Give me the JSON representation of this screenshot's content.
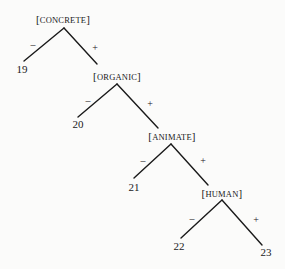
{
  "diagram": {
    "type": "binary-feature-tree",
    "nodes": [
      {
        "id": "concrete",
        "label_open": "[",
        "label_text": "CONCRETE",
        "label_close": "]",
        "minus_child": "19",
        "plus_child": "organic"
      },
      {
        "id": "organic",
        "label_open": "[",
        "label_text": "ORGANIC",
        "label_close": "]",
        "minus_child": "20",
        "plus_child": "animate"
      },
      {
        "id": "animate",
        "label_open": "[",
        "label_text": "ANIMATE",
        "label_close": "]",
        "minus_child": "21",
        "plus_child": "human"
      },
      {
        "id": "human",
        "label_open": "[",
        "label_text": "HUMAN",
        "label_close": "]",
        "minus_child": "22",
        "plus_child": "23"
      }
    ],
    "leaves": [
      {
        "id": "19",
        "label": "19"
      },
      {
        "id": "20",
        "label": "20"
      },
      {
        "id": "21",
        "label": "21"
      },
      {
        "id": "22",
        "label": "22"
      },
      {
        "id": "23",
        "label": "23"
      }
    ],
    "signs": {
      "minus": "–",
      "plus": "+"
    }
  }
}
